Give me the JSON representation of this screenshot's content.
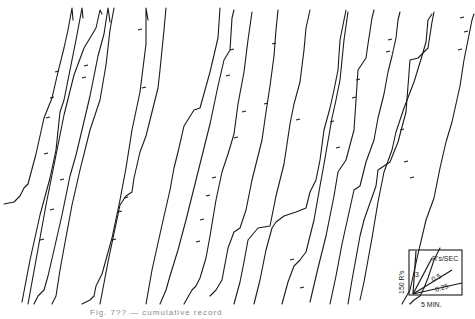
{
  "figure": {
    "caption": "Fig. 7??  —  cumulative record",
    "type": "cumulative-record"
  },
  "legend": {
    "y_scale_label": "150 R's",
    "x_scale_label": "5 MIN.",
    "rate_unit_label": "R's/SEC",
    "rate_labels": [
      "3",
      "0.5",
      "0.25"
    ]
  }
}
